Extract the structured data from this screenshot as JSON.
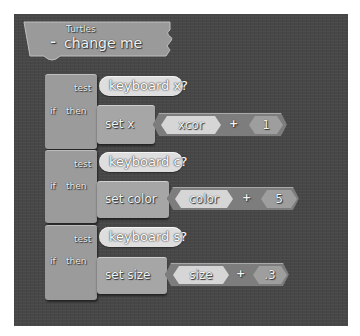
{
  "header": {
    "category": "Turtles",
    "collapse_symbol": "–",
    "title": "change me"
  },
  "if_blocks": [
    {
      "if_label": "if",
      "test_label": "test",
      "then_label": "then",
      "condition": "keyboard x?",
      "command": "set x",
      "expr_left": "xcor",
      "operator": "+",
      "expr_right": "1"
    },
    {
      "if_label": "if",
      "test_label": "test",
      "then_label": "then",
      "condition": "keyboard c?",
      "command": "set color",
      "expr_left": "color",
      "operator": "+",
      "expr_right": "5"
    },
    {
      "if_label": "if",
      "test_label": "test",
      "then_label": "then",
      "condition": "keyboard s?",
      "command": "set size",
      "expr_left": "size",
      "operator": "+",
      "expr_right": ".3"
    }
  ],
  "colors": {
    "canvas": "#474747",
    "block": "#9b9b9b",
    "command": "#a6a6a6",
    "boolean_pill": "#dedede",
    "expression": "#7d7d7d"
  }
}
